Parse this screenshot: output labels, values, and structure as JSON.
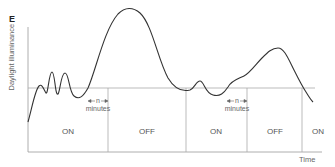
{
  "figure": {
    "panel_label": "E",
    "y_axis_label": "Daylight illuminance",
    "x_axis_label": "Time",
    "colors": {
      "curve": "#333333",
      "axes": "#999999",
      "grid": "#aaaaaa"
    }
  },
  "segments": [
    {
      "label": "ON"
    },
    {
      "label": "OFF"
    },
    {
      "label": "ON"
    },
    {
      "label": "OFF"
    },
    {
      "label": "ON"
    }
  ],
  "delays": [
    {
      "symbol": "n",
      "unit": "minutes"
    },
    {
      "symbol": "n",
      "unit": "minutes"
    }
  ]
}
